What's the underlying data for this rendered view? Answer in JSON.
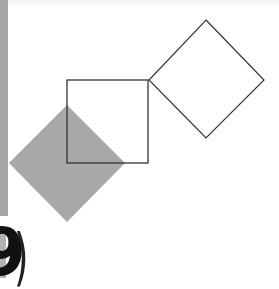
{
  "figure": {
    "background": "#ffffff",
    "left_strip_color": "#a6a6a6",
    "shapes": [
      {
        "name": "outline-diamond",
        "type": "diamond",
        "points": "206,20 264,80 206,138 149,80",
        "fill": "none",
        "stroke": "#333333"
      },
      {
        "name": "filled-diamond",
        "type": "diamond",
        "points": "67,105 125,163 67,222 9,163",
        "fill": "#a8a8a8",
        "stroke": "none"
      },
      {
        "name": "outline-square",
        "type": "square",
        "x": 67,
        "y": 80,
        "width": 81,
        "height": 83,
        "fill": "none",
        "stroke": "#333333"
      }
    ]
  },
  "label": {
    "digit": "9",
    "paren": ")"
  }
}
